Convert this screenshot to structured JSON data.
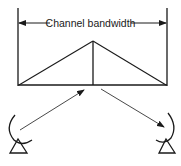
{
  "diagram": {
    "title_label": "Channel bandwidth",
    "colors": {
      "stroke": "#1a1a1a",
      "background": "#ffffff"
    },
    "elements": {
      "bandwidth_markers": "left and right vertical boundary lines",
      "spectrum": "triangular spectrum with center carrier line",
      "uplink_arrow": "arrow from left dish antenna up to spectrum",
      "downlink_arrow": "arrow from spectrum down to right dish antenna",
      "left_antenna": "transmitting dish antenna",
      "right_antenna": "receiving dish antenna"
    }
  }
}
